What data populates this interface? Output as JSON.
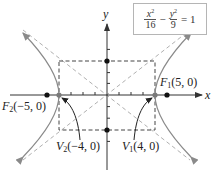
{
  "diagram": {
    "equation": {
      "term1": {
        "numerator_var": "x",
        "numerator_exp": "2",
        "denominator": "16"
      },
      "operator": "−",
      "term2": {
        "numerator_var": "y",
        "numerator_exp": "2",
        "denominator": "9"
      },
      "equals": "= 1"
    },
    "axes": {
      "x_label": "x",
      "y_label": "y"
    },
    "points": {
      "focus1": {
        "name": "F",
        "sub": "1",
        "coords": "(5, 0)"
      },
      "focus2": {
        "name": "F",
        "sub": "2",
        "coords": "(−5, 0)"
      },
      "vertex1": {
        "name": "V",
        "sub": "1",
        "coords": "(4, 0)"
      },
      "vertex2": {
        "name": "V",
        "sub": "2",
        "coords": "(−4, 0)"
      }
    },
    "params": {
      "a": 4,
      "b": 3,
      "c": 5
    },
    "colors": {
      "axis": "#333333",
      "curve": "#8a8a8a",
      "asymptote": "#b0b0b0",
      "rectangle": "#444444",
      "point": "#111111",
      "vertex_point": "#7a7a7a",
      "box_border": "#b5b5b5"
    }
  }
}
